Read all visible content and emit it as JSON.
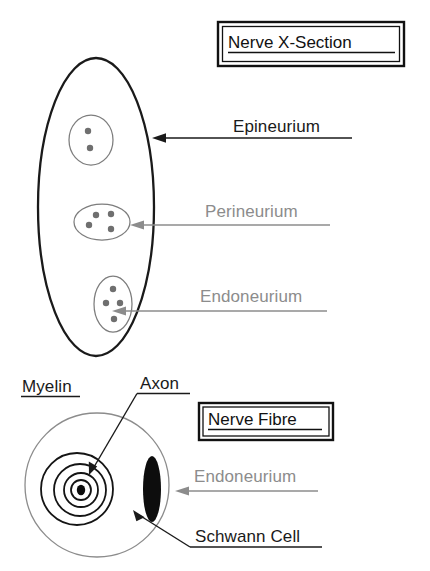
{
  "figure": {
    "title_top": "Nerve X-Section",
    "title_bottom": "Nerve Fibre",
    "background_color": "#ffffff"
  },
  "colors": {
    "black": "#1a1a1a",
    "gray": "#8c8c8c",
    "fascicle_outline": "#7d7d7d",
    "dot": "#6f6f6f",
    "ring": "#141414"
  },
  "cross_section": {
    "labels": [
      {
        "text": "Epineurium",
        "color": "black",
        "target": "epineurium-outer-ellipse"
      },
      {
        "text": "Perineurium",
        "color": "gray",
        "target": "perineurium-fascicle-middle"
      },
      {
        "text": "Endoneurium",
        "color": "gray",
        "target": "endoneurium-fascicle-bottom"
      }
    ],
    "fascicles": [
      {
        "name": "fascicle-top",
        "axon_count": 2
      },
      {
        "name": "fascicle-middle",
        "axon_count": 4
      },
      {
        "name": "fascicle-bottom",
        "axon_count": 4
      }
    ]
  },
  "nerve_fibre": {
    "labels": [
      {
        "text": "Myelin",
        "color": "black",
        "style": "underlined"
      },
      {
        "text": "Axon",
        "color": "black",
        "style": "leader-line"
      },
      {
        "text": "Endoneurium",
        "color": "gray",
        "style": "arrow"
      },
      {
        "text": "Schwann Cell",
        "color": "black",
        "style": "leader-line"
      }
    ],
    "myelin_ring_count": 4
  }
}
